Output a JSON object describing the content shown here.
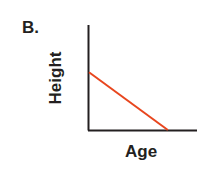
{
  "panel_label": "B.",
  "chart_data": {
    "type": "line",
    "title": "B.",
    "xlabel": "Age",
    "ylabel": "Height",
    "grid": false,
    "legend": null,
    "ticks": "none",
    "series": [
      {
        "name": "Height vs Age",
        "color": "#e8461e",
        "points": [
          [
            0,
            0.55
          ],
          [
            0.73,
            0
          ]
        ]
      }
    ],
    "xlim": [
      0,
      1
    ],
    "ylim": [
      0,
      1
    ]
  }
}
